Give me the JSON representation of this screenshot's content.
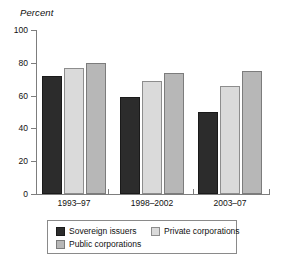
{
  "chart_data": {
    "type": "bar",
    "title": "Percent",
    "xlabel": "",
    "ylabel": "Percent",
    "ylim": [
      0,
      100
    ],
    "yticks": [
      0,
      20,
      40,
      60,
      80,
      100
    ],
    "grid": false,
    "legend_position": "bottom",
    "categories": [
      "1993–97",
      "1998–2002",
      "2003–07"
    ],
    "series": [
      {
        "name": "Sovereign issuers",
        "color": "#2c2c2c",
        "values": [
          72,
          59,
          50
        ]
      },
      {
        "name": "Private corporations",
        "color": "#dadada",
        "values": [
          77,
          69,
          66
        ]
      },
      {
        "name": "Public corporations",
        "color": "#b7b7b7",
        "values": [
          80,
          73.5,
          75
        ]
      }
    ]
  },
  "axis": {
    "title": "Percent",
    "tick_labels": [
      "100",
      "80",
      "60",
      "40",
      "20",
      "0"
    ]
  },
  "legend": {
    "entries": [
      {
        "label": "Sovereign issuers"
      },
      {
        "label": "Private corporations"
      },
      {
        "label": "Public corporations"
      }
    ]
  }
}
